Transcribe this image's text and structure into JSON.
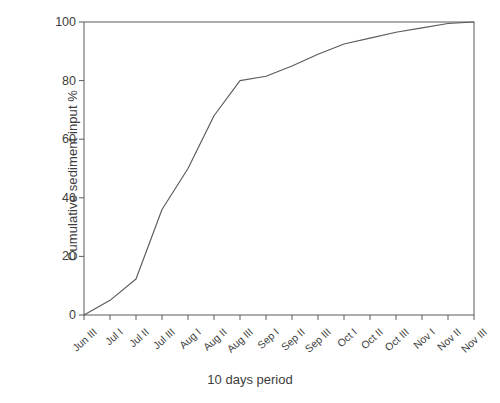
{
  "chart_data": {
    "type": "line",
    "title": "",
    "xlabel": "10 days period",
    "ylabel": "Cumulative sediment input %",
    "categories": [
      "Jun III",
      "Jul I",
      "Jul II",
      "Jul III",
      "Aug I",
      "Aug II",
      "Aug III",
      "Sep I",
      "Sep II",
      "Sep III",
      "Oct I",
      "Oct II",
      "Oct III",
      "Nov I",
      "Nov II",
      "Nov III"
    ],
    "values": [
      0,
      5,
      12.3,
      36,
      50,
      68,
      80,
      81.5,
      85,
      89,
      92.5,
      94.5,
      96.5,
      98,
      99.5,
      100
    ],
    "ylim": [
      0,
      100
    ],
    "ytick_labels": [
      "0",
      "20",
      "40",
      "60",
      "80",
      "100"
    ],
    "ytick_values": [
      0,
      20,
      40,
      60,
      80,
      100
    ],
    "grid": false,
    "legend": "none",
    "series_name": "Cumulative sediment input",
    "line_color": "#5b5b5b",
    "axis_color": "#5a5a5a",
    "background_color": "#ffffff"
  }
}
